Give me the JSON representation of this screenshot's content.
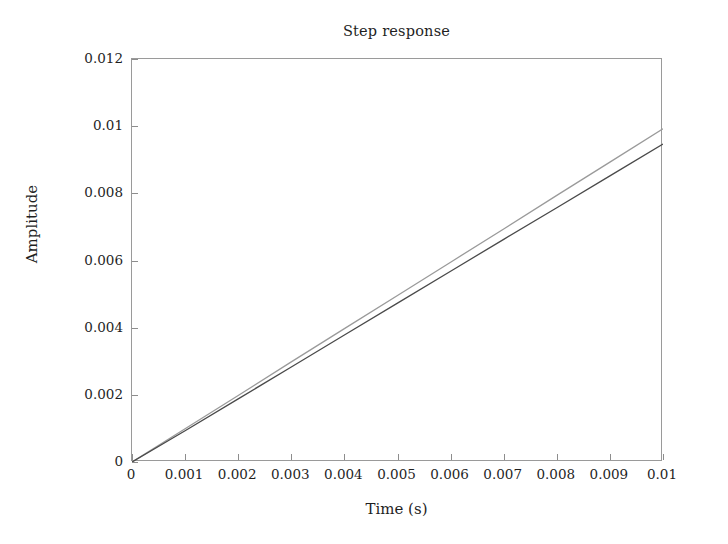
{
  "chart_data": {
    "type": "line",
    "title": "Step response",
    "xlabel": "Time (s)",
    "ylabel": "Amplitude",
    "xlim": [
      0,
      0.01
    ],
    "ylim": [
      0,
      0.012
    ],
    "grid": false,
    "legend": "none",
    "xticks": [
      "0",
      "0.001",
      "0.002",
      "0.003",
      "0.004",
      "0.005",
      "0.006",
      "0.007",
      "0.008",
      "0.009",
      "0.01"
    ],
    "xtick_values": [
      0,
      0.001,
      0.002,
      0.003,
      0.004,
      0.005,
      0.006,
      0.007,
      0.008,
      0.009,
      0.01
    ],
    "yticks": [
      "0",
      "0.002",
      "0.004",
      "0.006",
      "0.008",
      "0.01",
      "0.012"
    ],
    "ytick_values": [
      0,
      0.002,
      0.004,
      0.006,
      0.008,
      0.01,
      0.012
    ],
    "x": [
      0,
      0.001,
      0.002,
      0.003,
      0.004,
      0.005,
      0.006,
      0.007,
      0.008,
      0.009,
      0.01
    ],
    "series": [
      {
        "name": "upper-response",
        "color": "#9a9a9a",
        "values": [
          0,
          0.00099,
          0.00198,
          0.00298,
          0.00397,
          0.00496,
          0.00595,
          0.00694,
          0.00794,
          0.00893,
          0.00992
        ]
      },
      {
        "name": "lower-response",
        "color": "#4a4a4a",
        "values": [
          0,
          0.00093,
          0.00188,
          0.00283,
          0.00378,
          0.00473,
          0.00568,
          0.00663,
          0.00757,
          0.00852,
          0.00947
        ]
      }
    ]
  },
  "style": {
    "background": "#ffffff",
    "frame_color": "#9a9a9a",
    "text_color": "#1f1f1f",
    "tick_color": "#8d8d8d"
  }
}
